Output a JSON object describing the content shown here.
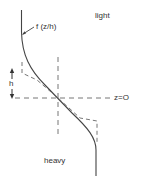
{
  "diagram": {
    "labels": {
      "profile_function": "f (z/h)",
      "upper_layer": "light",
      "lower_layer": "heavy",
      "interface_level": "z=O",
      "thickness": "h"
    },
    "colors": {
      "line": "#444444",
      "dashed": "#666666",
      "text": "#333333",
      "background": "#ffffff"
    }
  }
}
